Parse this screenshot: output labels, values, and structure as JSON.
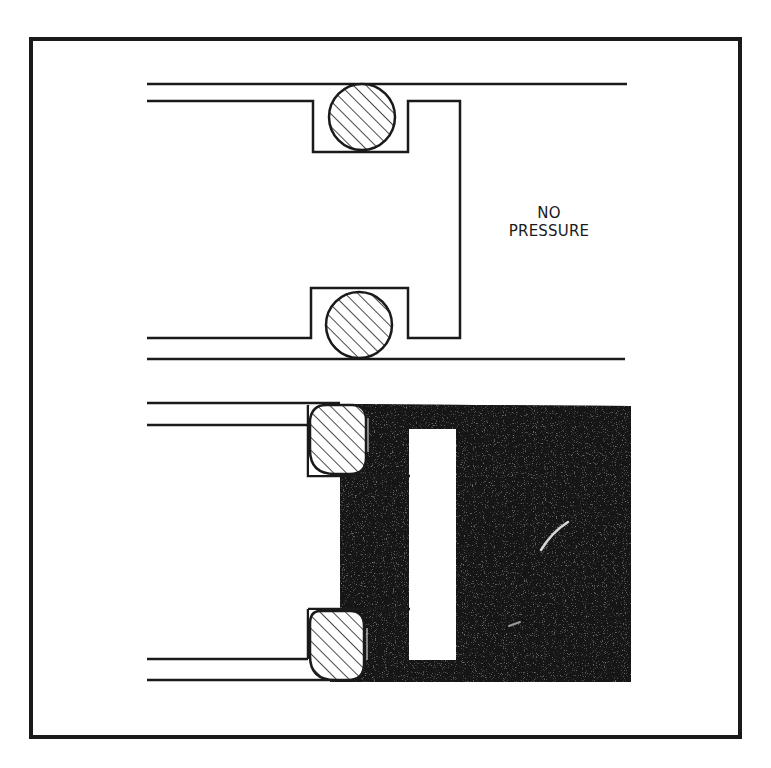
{
  "figure": {
    "frame_color": "#1a1a1a",
    "fluid_color": "#141414",
    "stroke_color": "#1a1a1a",
    "background": "#ffffff"
  },
  "top_diagram": {
    "label_line1": "NO",
    "label_line2": "PRESSURE",
    "seal_shape": "round O-ring (hatched)",
    "state": "no pressure"
  },
  "bottom_diagram": {
    "seal_shape": "deformed O-ring (hatched), pushed against groove wall",
    "state": "pressurized fluid filling chamber"
  }
}
